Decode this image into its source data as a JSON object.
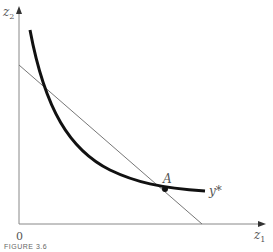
{
  "axes": {
    "y_label": "z",
    "y_label_sub": "2",
    "x_label": "z",
    "x_label_sub": "1",
    "origin_label": "0"
  },
  "curve": {
    "label": "y*",
    "description": "convex isoquant curve"
  },
  "line": {
    "description": "straight isocost line"
  },
  "point": {
    "label": "A",
    "description": "tangency point"
  },
  "caption": "FIGURE 3.6"
}
